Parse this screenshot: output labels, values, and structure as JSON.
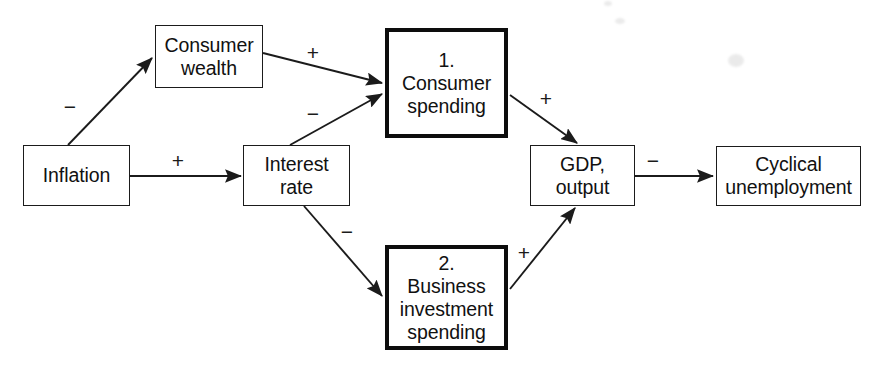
{
  "diagram": {
    "canvas": {
      "width": 883,
      "height": 375,
      "background": "#ffffff"
    },
    "stroke_color": "#1b1b1b",
    "nodes": [
      {
        "id": "inflation",
        "lines": [
          "Inflation"
        ],
        "emphasis": false,
        "box": {
          "x": 23,
          "y": 145,
          "w": 107,
          "h": 61
        }
      },
      {
        "id": "consumer-wealth",
        "lines": [
          "Consumer",
          "wealth"
        ],
        "emphasis": false,
        "box": {
          "x": 155,
          "y": 25,
          "w": 108,
          "h": 63
        }
      },
      {
        "id": "interest-rate",
        "lines": [
          "Interest",
          "rate"
        ],
        "emphasis": false,
        "box": {
          "x": 243,
          "y": 145,
          "w": 107,
          "h": 61
        }
      },
      {
        "id": "consumer-spending",
        "lines": [
          "1.",
          "Consumer",
          "spending"
        ],
        "emphasis": true,
        "box": {
          "x": 385,
          "y": 28,
          "w": 123,
          "h": 110
        }
      },
      {
        "id": "business-investment-spending",
        "lines": [
          "2.",
          "Business",
          "investment",
          "spending"
        ],
        "emphasis": true,
        "box": {
          "x": 385,
          "y": 245,
          "w": 123,
          "h": 105
        }
      },
      {
        "id": "gdp-output",
        "lines": [
          "GDP,",
          "output"
        ],
        "emphasis": false,
        "box": {
          "x": 530,
          "y": 145,
          "w": 105,
          "h": 61
        }
      },
      {
        "id": "cyclical-unemployment",
        "lines": [
          "Cyclical",
          "unemployment"
        ],
        "emphasis": false,
        "box": {
          "x": 716,
          "y": 146,
          "w": 145,
          "h": 60
        }
      }
    ],
    "edges": [
      {
        "id": "inflation-to-consumer-wealth",
        "from": "inflation",
        "to": "consumer-wealth",
        "sign": "−",
        "sign_pos": {
          "x": 70,
          "y": 106
        },
        "path": {
          "x1": 68,
          "y1": 145,
          "x2": 152,
          "y2": 58
        }
      },
      {
        "id": "inflation-to-interest-rate",
        "from": "inflation",
        "to": "interest-rate",
        "sign": "+",
        "sign_pos": {
          "x": 178,
          "y": 160
        },
        "path": {
          "x1": 130,
          "y1": 176,
          "x2": 241,
          "y2": 176
        }
      },
      {
        "id": "consumer-wealth-to-consumer-spending",
        "from": "consumer-wealth",
        "to": "consumer-spending",
        "sign": "+",
        "sign_pos": {
          "x": 313,
          "y": 52
        },
        "path": {
          "x1": 263,
          "y1": 53,
          "x2": 382,
          "y2": 83
        }
      },
      {
        "id": "interest-rate-to-consumer-spending",
        "from": "interest-rate",
        "to": "consumer-spending",
        "sign": "−",
        "sign_pos": {
          "x": 313,
          "y": 113
        },
        "path": {
          "x1": 290,
          "y1": 145,
          "x2": 382,
          "y2": 94
        }
      },
      {
        "id": "interest-rate-to-business-investment",
        "from": "interest-rate",
        "to": "business-investment-spending",
        "sign": "−",
        "sign_pos": {
          "x": 347,
          "y": 231
        },
        "path": {
          "x1": 304,
          "y1": 206,
          "x2": 382,
          "y2": 296
        }
      },
      {
        "id": "consumer-spending-to-gdp",
        "from": "consumer-spending",
        "to": "gdp-output",
        "sign": "+",
        "sign_pos": {
          "x": 546,
          "y": 98
        },
        "path": {
          "x1": 510,
          "y1": 95,
          "x2": 577,
          "y2": 143
        }
      },
      {
        "id": "business-investment-to-gdp",
        "from": "business-investment-spending",
        "to": "gdp-output",
        "sign": "+",
        "sign_pos": {
          "x": 524,
          "y": 252
        },
        "path": {
          "x1": 510,
          "y1": 289,
          "x2": 575,
          "y2": 208
        }
      },
      {
        "id": "gdp-to-cyclical-unemployment",
        "from": "gdp-output",
        "to": "cyclical-unemployment",
        "sign": "−",
        "sign_pos": {
          "x": 653,
          "y": 160
        },
        "path": {
          "x1": 635,
          "y1": 176,
          "x2": 713,
          "y2": 176
        }
      }
    ],
    "scan_artifacts": [
      {
        "x": 617,
        "y": 20,
        "w": 9,
        "h": 5
      },
      {
        "x": 730,
        "y": 56,
        "w": 14,
        "h": 11
      },
      {
        "x": 606,
        "y": 2,
        "w": 7,
        "h": 4
      }
    ]
  }
}
